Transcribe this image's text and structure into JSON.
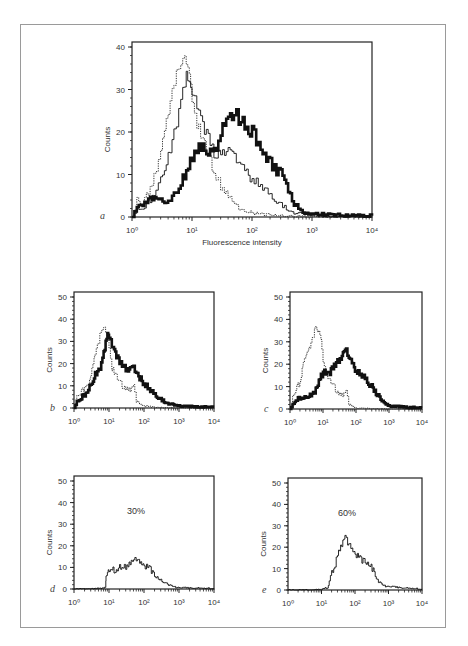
{
  "figure": {
    "panels": [
      {
        "id": "a",
        "label": "a",
        "xlabel": "Fluorescence intensity",
        "ylabel": "Counts",
        "annotation": ""
      },
      {
        "id": "b",
        "label": "b",
        "xlabel": "",
        "ylabel": "Counts",
        "annotation": ""
      },
      {
        "id": "c",
        "label": "c",
        "xlabel": "",
        "ylabel": "Counts",
        "annotation": ""
      },
      {
        "id": "d",
        "label": "d",
        "xlabel": "",
        "ylabel": "Counts",
        "annotation": "30%"
      },
      {
        "id": "e",
        "label": "e",
        "xlabel": "",
        "ylabel": "Counts",
        "annotation": "60%"
      }
    ]
  },
  "chart_data": [
    {
      "id": "a",
      "type": "line",
      "title": "",
      "panel_label": "a",
      "xlabel": "Fluorescence intensity",
      "ylabel": "Counts",
      "xscale": "log",
      "xlim": [
        1,
        10000
      ],
      "ylim": [
        0,
        40
      ],
      "xticks": [
        "10^0",
        "10^1",
        "10^2",
        "10^3",
        "10^4"
      ],
      "yticks": [
        0,
        10,
        20,
        30,
        40
      ],
      "series": [
        {
          "name": "dotted",
          "style": "dotted",
          "x": [
            1,
            1.2,
            1.5,
            2,
            2.5,
            3,
            4,
            5,
            6,
            7,
            8,
            9,
            10,
            12,
            15,
            20,
            25,
            30,
            40,
            50,
            60,
            70,
            100,
            150,
            200,
            300,
            500,
            1000,
            2000,
            10000
          ],
          "values": [
            0,
            4,
            3,
            7,
            10,
            15,
            25,
            32,
            35,
            38,
            37,
            34,
            28,
            22,
            19,
            13,
            10,
            7,
            5,
            3,
            2,
            1.5,
            1,
            0.5,
            0.5,
            0.3,
            0.2,
            0.1,
            0,
            0
          ]
        },
        {
          "name": "thin",
          "style": "thin",
          "x": [
            1,
            1.2,
            1.5,
            2,
            2.5,
            3,
            4,
            5,
            6,
            7,
            8,
            9,
            10,
            12,
            15,
            20,
            25,
            30,
            40,
            50,
            60,
            70,
            100,
            150,
            200,
            300,
            500,
            1000,
            2000,
            10000
          ],
          "values": [
            0,
            2,
            2,
            4,
            6,
            9,
            14,
            20,
            25,
            30,
            34,
            31,
            29,
            26,
            22,
            17,
            14,
            16,
            15,
            14,
            13,
            12,
            9,
            7,
            5,
            3,
            1,
            0.5,
            0,
            0
          ]
        },
        {
          "name": "thick",
          "style": "thick",
          "x": [
            1,
            1.2,
            1.5,
            2,
            3,
            4,
            5,
            6,
            7,
            8,
            10,
            12,
            15,
            20,
            25,
            30,
            40,
            50,
            60,
            70,
            100,
            150,
            200,
            300,
            400,
            500,
            700,
            1000,
            2000,
            10000
          ],
          "values": [
            0,
            2,
            3,
            4,
            4,
            4,
            5,
            7,
            9,
            11,
            14,
            16,
            16,
            15,
            16,
            20,
            23,
            25,
            23,
            22,
            20,
            16,
            13,
            10,
            6,
            3,
            1,
            0.8,
            0.5,
            0.3
          ]
        }
      ]
    },
    {
      "id": "b",
      "type": "line",
      "panel_label": "b",
      "ylabel": "Counts",
      "xscale": "log",
      "xlim": [
        1,
        10000
      ],
      "ylim": [
        0,
        50
      ],
      "xticks": [
        "10^0",
        "10^1",
        "10^2",
        "10^3",
        "10^4"
      ],
      "yticks": [
        0,
        10,
        20,
        30,
        40,
        50
      ],
      "series": [
        {
          "name": "dotted",
          "style": "dotted",
          "x": [
            1,
            1.2,
            1.5,
            2,
            3,
            4,
            5,
            6,
            7,
            8,
            10,
            12,
            15,
            20,
            30,
            40,
            50,
            60,
            80,
            100,
            150,
            200,
            300,
            500,
            1000,
            10000
          ],
          "values": [
            0,
            5,
            7,
            9,
            14,
            25,
            30,
            35,
            37,
            35,
            28,
            18,
            16,
            11,
            9,
            8,
            10,
            3,
            1.5,
            1,
            0.5,
            0.3,
            0.2,
            0.1,
            0,
            0
          ]
        },
        {
          "name": "thick",
          "style": "thick",
          "x": [
            1,
            1.2,
            1.5,
            2,
            3,
            4,
            5,
            6,
            7,
            8,
            9,
            10,
            12,
            15,
            20,
            30,
            40,
            50,
            60,
            80,
            100,
            150,
            200,
            300,
            500,
            1000,
            3000,
            10000
          ],
          "values": [
            0,
            3,
            4,
            6,
            10,
            15,
            17,
            20,
            25,
            30,
            33,
            32,
            28,
            25,
            20,
            18,
            17,
            18,
            16,
            13,
            11,
            8,
            6,
            4,
            2,
            1,
            0.5,
            0.5
          ]
        }
      ]
    },
    {
      "id": "c",
      "type": "line",
      "panel_label": "c",
      "ylabel": "Counts",
      "xscale": "log",
      "xlim": [
        1,
        10000
      ],
      "ylim": [
        0,
        50
      ],
      "xticks": [
        "10^0",
        "10^1",
        "10^2",
        "10^3",
        "10^4"
      ],
      "yticks": [
        0,
        10,
        20,
        30,
        40,
        50
      ],
      "series": [
        {
          "name": "dotted",
          "style": "dotted",
          "x": [
            1,
            1.2,
            1.5,
            2,
            2.5,
            3,
            4,
            5,
            6,
            7,
            8,
            10,
            12,
            15,
            20,
            30,
            40,
            50,
            60,
            80,
            100,
            200,
            500,
            1000,
            10000
          ],
          "values": [
            0,
            5,
            9,
            12,
            20,
            23,
            28,
            33,
            37,
            35,
            34,
            22,
            17,
            14,
            10,
            7,
            6,
            8,
            2,
            1,
            0.5,
            0.3,
            0.1,
            0,
            0
          ]
        },
        {
          "name": "thick",
          "style": "thick",
          "x": [
            1,
            1.2,
            1.5,
            2,
            3,
            4,
            5,
            6,
            8,
            10,
            12,
            15,
            20,
            25,
            30,
            40,
            50,
            60,
            70,
            100,
            150,
            200,
            300,
            400,
            600,
            800,
            1000,
            3000,
            10000
          ],
          "values": [
            0,
            2,
            4,
            5,
            5,
            6,
            7,
            9,
            13,
            17,
            16,
            16,
            18,
            21,
            22,
            24,
            26,
            23,
            22,
            17,
            15,
            13,
            10,
            7,
            4,
            2,
            1.5,
            0.8,
            0.5
          ]
        }
      ]
    },
    {
      "id": "d",
      "type": "line",
      "panel_label": "d",
      "ylabel": "Counts",
      "annotation": "30%",
      "xscale": "log",
      "xlim": [
        1,
        10000
      ],
      "ylim": [
        0,
        50
      ],
      "xticks": [
        "10^0",
        "10^1",
        "10^2",
        "10^3",
        "10^4"
      ],
      "yticks": [
        0,
        10,
        20,
        30,
        40,
        50
      ],
      "series": [
        {
          "name": "thin",
          "style": "thin",
          "x": [
            1,
            3,
            5,
            7,
            8,
            8.2,
            9,
            10,
            12,
            15,
            20,
            25,
            30,
            40,
            50,
            60,
            70,
            80,
            100,
            150,
            200,
            300,
            500,
            700,
            1000,
            3000,
            10000
          ],
          "values": [
            0,
            0,
            0.5,
            0.5,
            1,
            6,
            8,
            9,
            10,
            8,
            10,
            11,
            10,
            12,
            13,
            14,
            13,
            12,
            11,
            9,
            6,
            4,
            2,
            1,
            0.5,
            0.5,
            0.3
          ]
        }
      ]
    },
    {
      "id": "e",
      "type": "line",
      "panel_label": "e",
      "ylabel": "Counts",
      "annotation": "60%",
      "xscale": "log",
      "xlim": [
        1,
        10000
      ],
      "ylim": [
        0,
        50
      ],
      "xticks": [
        "10^0",
        "10^1",
        "10^2",
        "10^3",
        "10^4"
      ],
      "yticks": [
        0,
        10,
        20,
        30,
        40,
        50
      ],
      "series": [
        {
          "name": "thin",
          "style": "thin",
          "x": [
            1,
            5,
            10,
            15,
            17,
            20,
            25,
            30,
            40,
            50,
            60,
            70,
            80,
            100,
            150,
            200,
            300,
            400,
            500,
            700,
            1000,
            3000,
            10000
          ],
          "values": [
            0,
            0,
            0.5,
            1,
            4,
            8,
            12,
            17,
            21,
            25,
            22,
            21,
            19,
            17,
            14,
            13,
            11,
            7,
            4,
            2,
            1.5,
            1,
            0.5
          ]
        }
      ]
    }
  ]
}
